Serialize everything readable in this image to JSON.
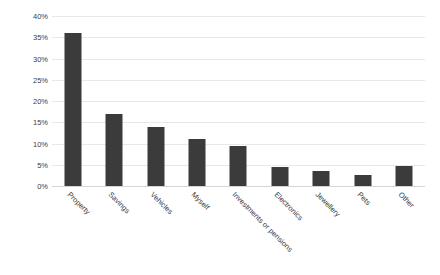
{
  "chart_data": {
    "type": "bar",
    "title": "",
    "xlabel": "",
    "ylabel": "Percentage of respondents",
    "ylim": [
      0,
      40
    ],
    "ytick_labels": [
      "40%",
      "35%",
      "30%",
      "25%",
      "20%",
      "15%",
      "10%",
      "5%",
      "0%"
    ],
    "ytick_values": [
      40,
      35,
      30,
      25,
      20,
      15,
      10,
      5,
      0
    ],
    "grid": true,
    "legend": "none",
    "bar_color": "#3b3b3b",
    "gridline_color": "#e8e8e8",
    "text_color": "#404040",
    "categories": [
      "Property",
      "Savings",
      "Vehicles",
      "Myself",
      "Investments or pensions",
      "Electronics",
      "Jewellery",
      "Pets",
      "Other"
    ],
    "values": [
      36,
      17,
      14,
      11,
      9.5,
      4.5,
      3.5,
      2.5,
      4.7
    ]
  }
}
